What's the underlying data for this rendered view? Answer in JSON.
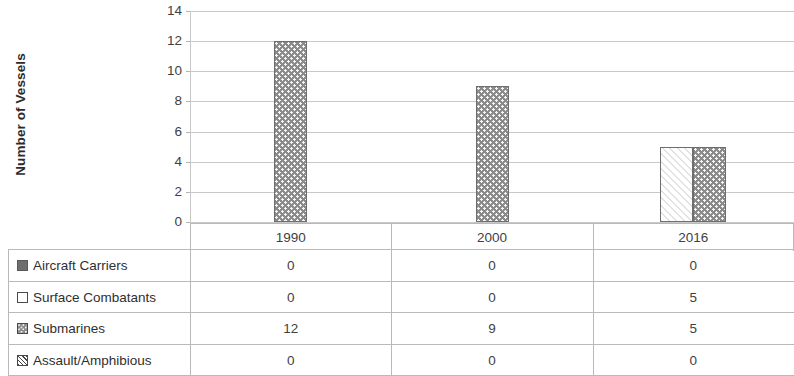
{
  "chart_data": {
    "type": "bar",
    "title": "",
    "xlabel": "",
    "ylabel": "Number of Vessels",
    "categories": [
      "1990",
      "2000",
      "2016"
    ],
    "ylim": [
      0,
      14
    ],
    "yticks": [
      0,
      2,
      4,
      6,
      8,
      10,
      12,
      14
    ],
    "grid": true,
    "legend_position": "data-table",
    "series": [
      {
        "name": "Aircraft Carriers",
        "values": [
          0,
          0,
          0
        ],
        "marker": "solid-dark-square"
      },
      {
        "name": "Surface Combatants",
        "values": [
          0,
          0,
          5
        ],
        "marker": "open-square"
      },
      {
        "name": "Submarines",
        "values": [
          12,
          9,
          5
        ],
        "marker": "dotted-gray-square"
      },
      {
        "name": "Assault/Amphibious",
        "values": [
          0,
          0,
          0
        ],
        "marker": "hatched-square"
      }
    ]
  },
  "axis": {
    "y_title": "Number of Vessels",
    "y_ticks": [
      "14",
      "12",
      "10",
      "8",
      "6",
      "4",
      "2",
      "0"
    ]
  },
  "categories": [
    "1990",
    "2000",
    "2016"
  ],
  "table": {
    "rows": [
      {
        "label": "Aircraft Carriers",
        "values": [
          "0",
          "0",
          "0"
        ]
      },
      {
        "label": "Surface Combatants",
        "values": [
          "0",
          "0",
          "5"
        ]
      },
      {
        "label": "Submarines",
        "values": [
          "12",
          "9",
          "5"
        ]
      },
      {
        "label": "Assault/Amphibious",
        "values": [
          "0",
          "0",
          "0"
        ]
      }
    ]
  },
  "colors": {
    "submarines_fill": "#8a8a8a",
    "carriers_fill": "#6e6e6e",
    "surface_fill": "#ffffff",
    "grid": "#c9c9c9",
    "text": "#3f3f3f"
  }
}
